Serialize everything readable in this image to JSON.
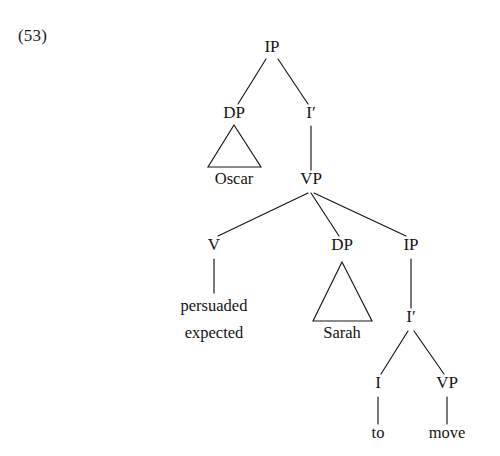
{
  "figure": {
    "example_number": "(53)",
    "ink_color": "#141414",
    "background_color": "#ffffff"
  },
  "tree": {
    "nodes": {
      "ip_root": {
        "label": "IP",
        "x": 272,
        "y": 52
      },
      "dp_subject": {
        "label": "DP",
        "x": 234,
        "y": 118
      },
      "i_bar_matrix": {
        "label": "I′",
        "x": 311,
        "y": 118
      },
      "oscar": {
        "label": "Oscar",
        "x": 234,
        "y": 184
      },
      "vp_matrix": {
        "label": "VP",
        "x": 311,
        "y": 184
      },
      "v_head": {
        "label": "V",
        "x": 214,
        "y": 250
      },
      "dp_object": {
        "label": "DP",
        "x": 342,
        "y": 250
      },
      "ip_embedded": {
        "label": "IP",
        "x": 411,
        "y": 250
      },
      "persuaded": {
        "label": "persuaded",
        "x": 214,
        "y": 311
      },
      "expected": {
        "label": "expected",
        "x": 214,
        "y": 338
      },
      "sarah": {
        "label": "Sarah",
        "x": 342,
        "y": 338
      },
      "i_bar_embed": {
        "label": "I′",
        "x": 411,
        "y": 322
      },
      "i_head": {
        "label": "I",
        "x": 378,
        "y": 388
      },
      "vp_embedded": {
        "label": "VP",
        "x": 447,
        "y": 388
      },
      "to": {
        "label": "to",
        "x": 378,
        "y": 438
      },
      "move": {
        "label": "move",
        "x": 447,
        "y": 438
      }
    },
    "edges": [
      {
        "name": "edge-ip-to-dp-subject",
        "x1": 266,
        "y1": 59,
        "x2": 238,
        "y2": 104
      },
      {
        "name": "edge-ip-to-i-bar",
        "x1": 278,
        "y1": 59,
        "x2": 308,
        "y2": 104
      },
      {
        "name": "edge-i-bar-to-vp",
        "x1": 311,
        "y1": 126,
        "x2": 311,
        "y2": 170
      },
      {
        "name": "edge-vp-to-v",
        "x1": 308,
        "y1": 193,
        "x2": 218,
        "y2": 236
      },
      {
        "name": "edge-vp-to-dp-object",
        "x1": 311,
        "y1": 193,
        "x2": 339,
        "y2": 236
      },
      {
        "name": "edge-vp-to-ip-embedded",
        "x1": 314,
        "y1": 193,
        "x2": 406,
        "y2": 236
      },
      {
        "name": "edge-v-to-verb",
        "x1": 214,
        "y1": 259,
        "x2": 214,
        "y2": 293
      },
      {
        "name": "edge-ip-to-i-bar-embed",
        "x1": 411,
        "y1": 259,
        "x2": 411,
        "y2": 308
      },
      {
        "name": "edge-i-bar-to-i",
        "x1": 408,
        "y1": 331,
        "x2": 381,
        "y2": 374
      },
      {
        "name": "edge-i-bar-to-vp-embed",
        "x1": 414,
        "y1": 331,
        "x2": 444,
        "y2": 374
      },
      {
        "name": "edge-i-to-to",
        "x1": 378,
        "y1": 397,
        "x2": 378,
        "y2": 424
      },
      {
        "name": "edge-vp-to-move",
        "x1": 447,
        "y1": 397,
        "x2": 447,
        "y2": 424
      }
    ],
    "triangles": [
      {
        "name": "triangle-oscar",
        "apex_x": 234,
        "apex_y": 125,
        "left_x": 208,
        "right_x": 261,
        "base_y": 167
      },
      {
        "name": "triangle-sarah",
        "apex_x": 342,
        "apex_y": 262,
        "left_x": 313,
        "right_x": 372,
        "base_y": 321
      }
    ]
  }
}
